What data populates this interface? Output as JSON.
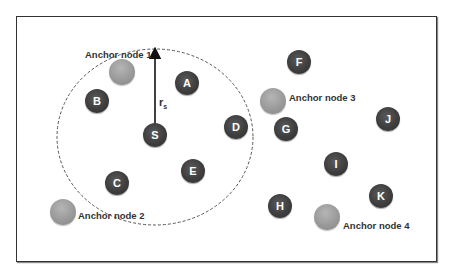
{
  "diagram": {
    "type": "wireless sensor network localization",
    "frame": {
      "x": 16,
      "y": 16,
      "width": 419,
      "height": 244
    },
    "range_circle": {
      "cx": 155,
      "cy": 137,
      "rx": 98,
      "ry": 88,
      "style": "dashed"
    },
    "sensor_node": {
      "id": "S",
      "label": "S",
      "x": 155,
      "y": 135
    },
    "radius_label": {
      "text": "r",
      "subscript": "s"
    },
    "unknown_nodes": [
      {
        "label": "A",
        "x": 187,
        "y": 83
      },
      {
        "label": "B",
        "x": 97,
        "y": 101
      },
      {
        "label": "C",
        "x": 117,
        "y": 183
      },
      {
        "label": "D",
        "x": 236,
        "y": 127
      },
      {
        "label": "E",
        "x": 193,
        "y": 171
      },
      {
        "label": "F",
        "x": 299,
        "y": 62
      },
      {
        "label": "G",
        "x": 286,
        "y": 129
      },
      {
        "label": "H",
        "x": 280,
        "y": 206
      },
      {
        "label": "I",
        "x": 336,
        "y": 164
      },
      {
        "label": "J",
        "x": 388,
        "y": 119
      },
      {
        "label": "K",
        "x": 381,
        "y": 196
      }
    ],
    "anchor_nodes": [
      {
        "label": "Anchor node 1",
        "x": 122,
        "y": 72,
        "label_x": 85,
        "label_y": 54
      },
      {
        "label": "Anchor node 2",
        "x": 63,
        "y": 212,
        "label_x": 78,
        "label_y": 215
      },
      {
        "label": "Anchor node 3",
        "x": 273,
        "y": 101,
        "label_x": 289,
        "label_y": 97
      },
      {
        "label": "Anchor node 4",
        "x": 327,
        "y": 217,
        "label_x": 343,
        "label_y": 225
      }
    ],
    "colors": {
      "node": "#3e3e3e",
      "anchor": "#9a9a9a",
      "frame": "#333333",
      "text": "#333333"
    }
  }
}
